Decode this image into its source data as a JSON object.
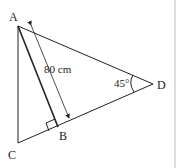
{
  "diagram": {
    "type": "geometry",
    "points": {
      "A": {
        "label": "A",
        "x": 18,
        "y": 26
      },
      "B": {
        "label": "B",
        "x": 58,
        "y": 127
      },
      "C": {
        "label": "C",
        "x": 18,
        "y": 143
      },
      "D": {
        "label": "D",
        "x": 153,
        "y": 84
      }
    },
    "segments": [
      "AC",
      "AD",
      "CD",
      "AB"
    ],
    "annotations": {
      "length_AB": "80 cm",
      "angle_D": "45°",
      "right_angle_at": "B"
    },
    "colors": {
      "stroke": "#222222",
      "background": "#ffffff",
      "border": "#bbbbbb"
    }
  }
}
